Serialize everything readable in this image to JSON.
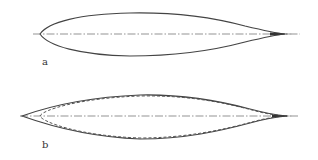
{
  "figure": {
    "panels": [
      {
        "id": "a",
        "label": "a",
        "description": "streamlined body profile with centerline"
      },
      {
        "id": "b",
        "label": "b",
        "description": "symmetric spindle profile (solid) overlaid with dashed comparison profile and centerline"
      }
    ]
  }
}
